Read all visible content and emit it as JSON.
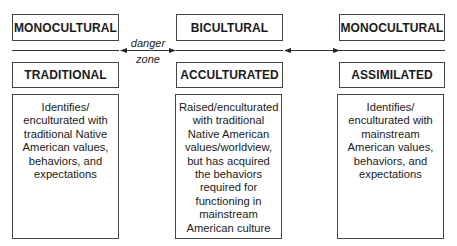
{
  "columns": [
    {
      "category": "MONOCULTURAL",
      "type": "TRADITIONAL",
      "description": "Identifies/ enculturated with traditional Native American values, behaviors, and expectations"
    },
    {
      "category": "BICULTURAL",
      "type": "ACCULTURATED",
      "description": "Raised/enculturated with traditional Native American values/worldview, but has acquired the behaviors required for functioning in mainstream American culture"
    },
    {
      "category": "MONOCULTURAL",
      "type": "ASSIMILATED",
      "description": "Identifies/ enculturated with mainstream American values, behaviors, and expectations"
    }
  ],
  "connectors": {
    "left_label_line1": "danger",
    "left_label_line2": "zone",
    "right_label": ""
  },
  "colors": {
    "border": "#444444",
    "text": "#1a1a1a",
    "background": "#ffffff"
  }
}
